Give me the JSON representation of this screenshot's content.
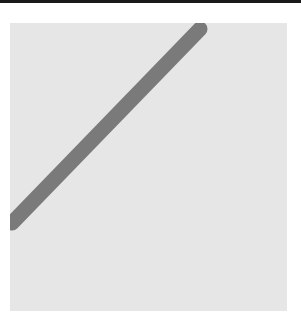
{
  "figure": {
    "background_color": "#e6e6e6",
    "border_color": "#1a1a1a",
    "line": {
      "color": "#7a7a7a",
      "width": 15,
      "start": {
        "x": 190,
        "y": 6
      },
      "end": {
        "x": 2,
        "y": 200
      }
    }
  }
}
